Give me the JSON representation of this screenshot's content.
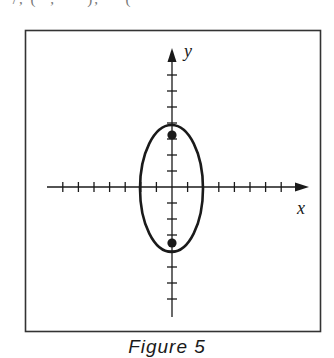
{
  "figure": {
    "caption": "Figure 5",
    "top_fragment": "  ·       /,  ( ·, · · ), ·· (  ·"
  },
  "axes": {
    "x_label": "x",
    "y_label": "y",
    "x_ticks_each_side": 8,
    "y_ticks_each_side": 8,
    "tick_spacing_units": 1
  },
  "ellipse": {
    "center": [
      0,
      0
    ],
    "semi_major_axis_y": 4,
    "semi_minor_axis_x": 2,
    "orientation": "vertical"
  },
  "points": [
    {
      "label": "focus-top",
      "x": 0,
      "y": 3.4
    },
    {
      "label": "focus-bottom",
      "x": 0,
      "y": -3.4
    }
  ],
  "colors": {
    "stroke": "#1a1a1a",
    "frame": "#333333",
    "background": "#ffffff"
  }
}
